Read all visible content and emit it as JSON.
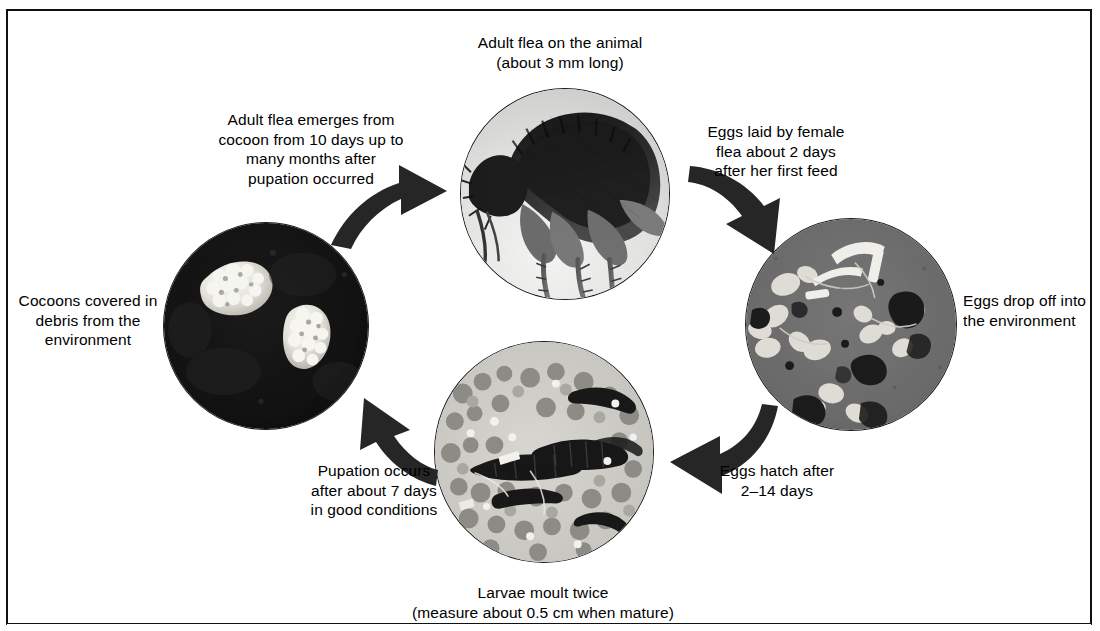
{
  "figure": {
    "background_color": "#ffffff",
    "border_color": "#111111"
  },
  "labels": {
    "adult_flea": "Adult flea on the animal\n(about 3 mm long)",
    "adult_emerges": "Adult flea emerges from\ncocoon from 10 days up to\nmany months after\npupation occurred",
    "eggs_laid": "Eggs laid by female\nflea about 2 days\nafter her first feed",
    "eggs_drop": "Eggs drop off into\nthe environment",
    "eggs_hatch": "Eggs hatch after\n2–14 days",
    "larvae_moult": "Larvae moult twice\n(measure about 0.5 cm when mature)",
    "pupation": "Pupation occurs\nafter about 7 days\nin good conditions",
    "cocoons": "Cocoons covered in\ndebris from the\nenvironment"
  },
  "photos": [
    {
      "name": "adult-flea-photo",
      "subject": "Adult flea seen under microscope",
      "background_tone": "#e8e8e6",
      "subject_tone": "#2b2b2b",
      "stage": "adult"
    },
    {
      "name": "flea-eggs-photo",
      "subject": "Flea eggs and debris under microscope",
      "background_tone": "#6d6d6d",
      "subject_tone": "#e9e9e7",
      "stage": "eggs"
    },
    {
      "name": "flea-larvae-photo",
      "subject": "Flea larvae among granular debris",
      "background_tone": "#cfcdc8",
      "subject_tone": "#1f1f1f",
      "stage": "larvae"
    },
    {
      "name": "flea-cocoons-photo",
      "subject": "Two cocoons covered in debris on dark field",
      "background_tone": "#141414",
      "subject_tone": "#f2f1ec",
      "stage": "cocoon"
    }
  ],
  "arrows": [
    {
      "name": "arrow-cocoons-to-adult",
      "from": "cocoons",
      "to": "adult-flea",
      "direction": "up-right"
    },
    {
      "name": "arrow-adult-to-eggs",
      "from": "adult-flea",
      "to": "eggs",
      "direction": "down-right"
    },
    {
      "name": "arrow-eggs-to-larvae",
      "from": "eggs",
      "to": "larvae",
      "direction": "down-left"
    },
    {
      "name": "arrow-larvae-to-cocoons",
      "from": "larvae",
      "to": "cocoons",
      "direction": "up-left"
    }
  ]
}
